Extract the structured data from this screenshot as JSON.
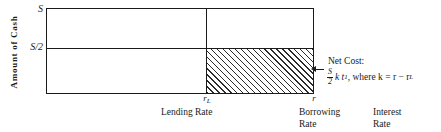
{
  "chart_data": {
    "type": "area",
    "title": "",
    "ylabel": "Amount of Cash",
    "xlabel": "Interest Rate",
    "y_ticks": [
      {
        "label": "S",
        "value": 1.0
      },
      {
        "label": "S/2",
        "value": 0.5
      }
    ],
    "x_ticks": [
      {
        "label": "r",
        "sub": "L",
        "value": "r_L",
        "caption": "Lending Rate"
      },
      {
        "label": "r",
        "sub": "",
        "value": "r",
        "caption": "Borrowing Rate"
      }
    ],
    "regions": [
      {
        "name": "net-cost-hatched-region",
        "x_from": "r_L",
        "x_to": "r",
        "y_from": 0,
        "y_to": 0.5,
        "fill": "diagonal-hatch",
        "annotation": "Net Cost"
      }
    ],
    "annotation": {
      "title": "Net Cost:",
      "formula_numerator": "S",
      "formula_denominator": "2",
      "formula_rest": "k t",
      "formula_sub": "1",
      "formula_tail": ", where k = r − r",
      "formula_tail_sub": "L",
      "formula_plain": "S/2 k t₁, where k = r − r_L"
    },
    "grid": false,
    "legend": "none"
  },
  "axes": {
    "y_label": "Amount  of  Cash",
    "tick_s": "S",
    "tick_s_half": "S/2",
    "tick_rl_base": "r",
    "tick_rl_sub": "L",
    "tick_r": "r"
  },
  "captions": {
    "lending_rate_line1": "Lending Rate",
    "borrowing_rate_line1": "Borrowing",
    "borrowing_rate_line2": "Rate",
    "interest_rate_line1": "Interest",
    "interest_rate_line2": "Rate"
  },
  "annotation": {
    "title": "Net Cost:",
    "num": "S",
    "den": "2",
    "mid": "k t",
    "mid_sub": "1",
    "tail": ", where k = r − r",
    "tail_sub": "L"
  },
  "colors": {
    "ink": "#1a1a1a",
    "hatch": "#2b2b2b",
    "background": "#ffffff"
  }
}
